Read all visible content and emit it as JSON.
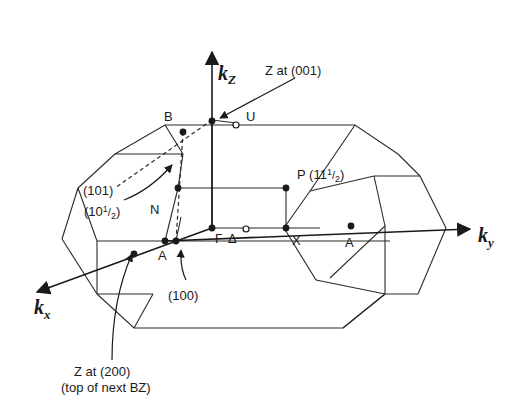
{
  "diagram": {
    "type": "brillouin-zone-3d",
    "axes": {
      "kz": {
        "main": "k",
        "sub": "Z"
      },
      "ky": {
        "main": "k",
        "sub": "y"
      },
      "kx": {
        "main": "k",
        "sub": "x"
      }
    },
    "points": {
      "B": "B",
      "U": "U",
      "N": "N",
      "P": "P",
      "Gamma": "Γ",
      "Delta": "Δ",
      "X": "X",
      "A_left": "A",
      "A_right": "A"
    },
    "annotations": {
      "z001": "Z at (001)",
      "p_label": "(11",
      "p_frac_num": "1",
      "p_frac_den": "2",
      "p_close": ")",
      "l101": "(101)",
      "l10half": "(10",
      "l10half_num": "1",
      "l10half_den": "2",
      "l10half_close": ")",
      "l100": "(100)",
      "z200_line1": "Z at (200)",
      "z200_line2": "(top of next BZ)"
    }
  }
}
